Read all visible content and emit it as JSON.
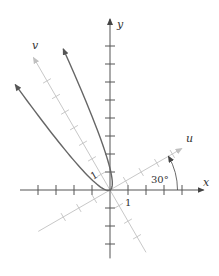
{
  "figure": {
    "type": "rotated-axes-parabola",
    "origin_px": [
      110,
      190
    ],
    "unit_px": 18,
    "rotation_deg": 30,
    "colors": {
      "axis": "#555555",
      "rotated_axis": "#c8c8c8",
      "curve": "#666666",
      "text": "#333333"
    },
    "axes": {
      "x": {
        "label": "x",
        "min": -5,
        "max": 5.2,
        "ticks": [
          -4,
          -3,
          -2,
          -1,
          1,
          2,
          3,
          4
        ]
      },
      "y": {
        "label": "y",
        "min": -3.8,
        "max": 9.5,
        "ticks": [
          -3,
          -2,
          -1,
          1,
          2,
          3,
          4,
          5,
          6,
          7,
          8
        ]
      },
      "u": {
        "label": "u",
        "min": -4.6,
        "max": 4.6,
        "ticks": [
          -3,
          -2,
          -1,
          1,
          2,
          3,
          4
        ]
      },
      "v": {
        "label": "v",
        "min": -4,
        "max": 8.5,
        "ticks": [
          -3,
          -2,
          -1,
          1,
          2,
          3,
          4,
          5,
          6,
          7
        ]
      }
    },
    "labels": {
      "x_axis": "x",
      "y_axis": "y",
      "u_axis": "u",
      "v_axis": "v",
      "angle": "30°",
      "x_unit": "1",
      "v_unit": "1"
    },
    "curve": {
      "equation": "v = 2.9 u^2",
      "k": 2.9,
      "u_range": [
        -1.63,
        1.67
      ]
    }
  }
}
